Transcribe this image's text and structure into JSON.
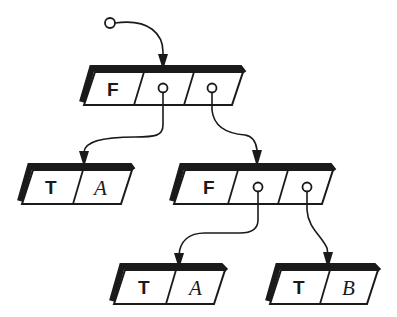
{
  "diagram": {
    "type": "linked-record tree (cons cells)",
    "colors": {
      "ink": "#1a1a1a",
      "background": "#ffffff"
    },
    "root_pointer": {
      "label": "root-pointer",
      "icon": "circle-pointer"
    },
    "nodes": [
      {
        "id": "root",
        "tag": "F",
        "cells": [
          "F",
          "ptr",
          "ptr"
        ]
      },
      {
        "id": "left-leaf",
        "tag": "T",
        "value": "A"
      },
      {
        "id": "right-inner",
        "tag": "F",
        "cells": [
          "F",
          "ptr",
          "ptr"
        ]
      },
      {
        "id": "bottom-left-leaf",
        "tag": "T",
        "value": "A"
      },
      {
        "id": "bottom-right-leaf",
        "tag": "T",
        "value": "B"
      }
    ],
    "labels": {
      "root_tag": "F",
      "left_leaf_tag": "T",
      "left_leaf_value": "A",
      "right_inner_tag": "F",
      "bottom_left_tag": "T",
      "bottom_left_value": "A",
      "bottom_right_tag": "T",
      "bottom_right_value": "B"
    },
    "edges": [
      {
        "from": "root-pointer",
        "to": "root"
      },
      {
        "from": "root.cell1",
        "to": "left-leaf"
      },
      {
        "from": "root.cell2",
        "to": "right-inner"
      },
      {
        "from": "right-inner.cell1",
        "to": "bottom-left-leaf"
      },
      {
        "from": "right-inner.cell2",
        "to": "bottom-right-leaf"
      }
    ]
  }
}
